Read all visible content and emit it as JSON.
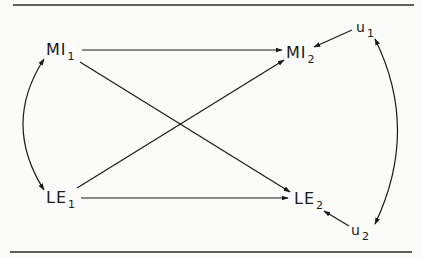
{
  "figure": {
    "type": "path-diagram",
    "style": {
      "line_color": "#1a1a1a",
      "background": "#fbfbfa"
    }
  },
  "nodes": {
    "mi1": {
      "base": "MI",
      "sub": "1"
    },
    "mi2": {
      "base": "MI",
      "sub": "2"
    },
    "le1": {
      "base": "LE",
      "sub": "1"
    },
    "le2": {
      "base": "LE",
      "sub": "2"
    },
    "u1": {
      "base": "u",
      "sub": "1"
    },
    "u2": {
      "base": "u",
      "sub": "2"
    }
  },
  "edges": [
    {
      "from": "MI1",
      "to": "MI2",
      "kind": "directed"
    },
    {
      "from": "MI1",
      "to": "LE2",
      "kind": "directed"
    },
    {
      "from": "LE1",
      "to": "MI2",
      "kind": "directed"
    },
    {
      "from": "LE1",
      "to": "LE2",
      "kind": "directed"
    },
    {
      "from": "MI1",
      "to": "LE1",
      "kind": "bidirectional-curved"
    },
    {
      "from": "u1",
      "to": "u2",
      "kind": "bidirectional-curved"
    },
    {
      "from": "u1",
      "to": "MI2",
      "kind": "directed"
    },
    {
      "from": "u2",
      "to": "LE2",
      "kind": "directed"
    }
  ]
}
